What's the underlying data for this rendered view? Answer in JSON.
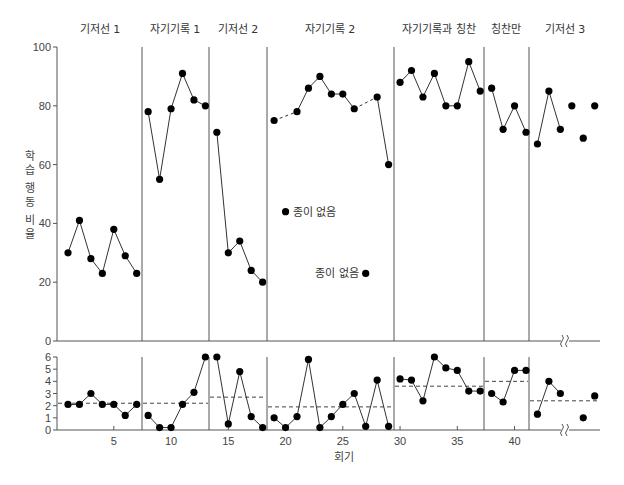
{
  "chart_data": [
    {
      "type": "line",
      "panel": "upper",
      "title": "",
      "ylabel": "학습 행동 비율",
      "xlabel": "",
      "ylim": [
        0,
        100
      ],
      "yticks": [
        0,
        20,
        40,
        60,
        80,
        100
      ],
      "grid": false,
      "phases": [
        {
          "label": "기저선 1",
          "sessions": [
            1,
            2,
            3,
            4,
            5,
            6,
            7
          ],
          "values": [
            30,
            41,
            28,
            23,
            38,
            29,
            23
          ]
        },
        {
          "label": "자기기록 1",
          "sessions": [
            8,
            9,
            10,
            11,
            12,
            13
          ],
          "values": [
            78,
            55,
            79,
            91,
            82,
            80
          ]
        },
        {
          "label": "기저선 2",
          "sessions": [
            14,
            15,
            16,
            17,
            18
          ],
          "values": [
            71,
            30,
            34,
            24,
            20
          ]
        },
        {
          "label": "자기기록 2",
          "sessions": [
            19,
            21,
            22,
            23,
            24,
            25,
            26,
            28,
            29
          ],
          "values": [
            75,
            78,
            86,
            90,
            84,
            84,
            79,
            83,
            60
          ],
          "dashed_segments": [
            [
              19,
              21
            ],
            [
              26,
              28
            ]
          ]
        },
        {
          "label": "자기기록과 칭찬",
          "sessions": [
            30,
            31,
            32,
            33,
            34,
            35,
            36,
            37
          ],
          "values": [
            88,
            92,
            83,
            91,
            80,
            80,
            95,
            85
          ]
        },
        {
          "label": "칭찬만",
          "sessions": [
            38,
            39,
            40,
            41
          ],
          "values": [
            86,
            72,
            80,
            71
          ]
        },
        {
          "label": "기저선 3",
          "sessions": [
            42,
            43,
            44,
            45,
            46,
            47
          ],
          "values": [
            67,
            85,
            72,
            80,
            69,
            80
          ],
          "connected_until": 44
        }
      ],
      "annotations": [
        {
          "text": "종이 없음",
          "session": 20,
          "value": 44,
          "side": "right"
        },
        {
          "text": "종이 없음",
          "session": 27,
          "value": 23,
          "side": "left"
        }
      ],
      "axis_break_after_session": 44
    },
    {
      "type": "line",
      "panel": "lower",
      "xlabel": "회기",
      "ylabel": "",
      "ylim": [
        0,
        6
      ],
      "yticks": [
        0,
        1,
        2,
        3,
        4,
        5,
        6
      ],
      "xticks": [
        5,
        10,
        15,
        20,
        25,
        30,
        35,
        40
      ],
      "grid": false,
      "phases": [
        {
          "label": "기저선 1",
          "sessions": [
            1,
            2,
            3,
            4,
            5,
            6,
            7
          ],
          "values": [
            2.1,
            2.1,
            3,
            2.1,
            2.1,
            1.2,
            2.1
          ],
          "mean": 2.2
        },
        {
          "label": "자기기록 1",
          "sessions": [
            8,
            9,
            10,
            11,
            12,
            13
          ],
          "values": [
            1.2,
            0.2,
            0.2,
            2.1,
            3.1,
            6
          ],
          "mean": 2.2
        },
        {
          "label": "기저선 2",
          "sessions": [
            14,
            15,
            16,
            17,
            18
          ],
          "values": [
            6,
            0.5,
            4.8,
            1.1,
            0.2
          ],
          "mean": 2.7
        },
        {
          "label": "자기기록 2",
          "sessions": [
            19,
            20,
            21,
            22,
            23,
            24,
            25,
            26,
            27,
            28,
            29
          ],
          "values": [
            1,
            0.2,
            1.1,
            5.8,
            0.2,
            1.1,
            2.1,
            3,
            0.3,
            4.1,
            0.3
          ],
          "mean": 1.9
        },
        {
          "label": "자기기록과 칭찬",
          "sessions": [
            30,
            31,
            32,
            33,
            34,
            35,
            36,
            37
          ],
          "values": [
            4.2,
            4.1,
            2.4,
            6,
            5.1,
            4.9,
            3.2,
            3.2
          ],
          "mean": 3.6
        },
        {
          "label": "칭찬만",
          "sessions": [
            38,
            39,
            40,
            41
          ],
          "values": [
            3,
            2.3,
            4.9,
            4.9
          ],
          "mean": 4
        },
        {
          "label": "기저선 3",
          "sessions": [
            42,
            43,
            44,
            46,
            47
          ],
          "values": [
            1.3,
            4,
            3,
            1,
            2.8
          ],
          "mean": 2.4,
          "connected_until": 44
        }
      ],
      "axis_break_after_session": 44
    }
  ],
  "labels": {
    "phases": [
      "기저선 1",
      "자기기록 1",
      "기저선 2",
      "자기기록 2",
      "자기기록과 칭찬",
      "칭찬만",
      "기저선 3"
    ],
    "y_axis_title": "학습 행동 비율",
    "x_axis_title": "회기",
    "no_paper_note": "종이 없음"
  },
  "colors": {
    "line": "#333333",
    "marker": "#000000",
    "axis": "#555555",
    "divider": "#555555",
    "mean_line": "#444444"
  }
}
